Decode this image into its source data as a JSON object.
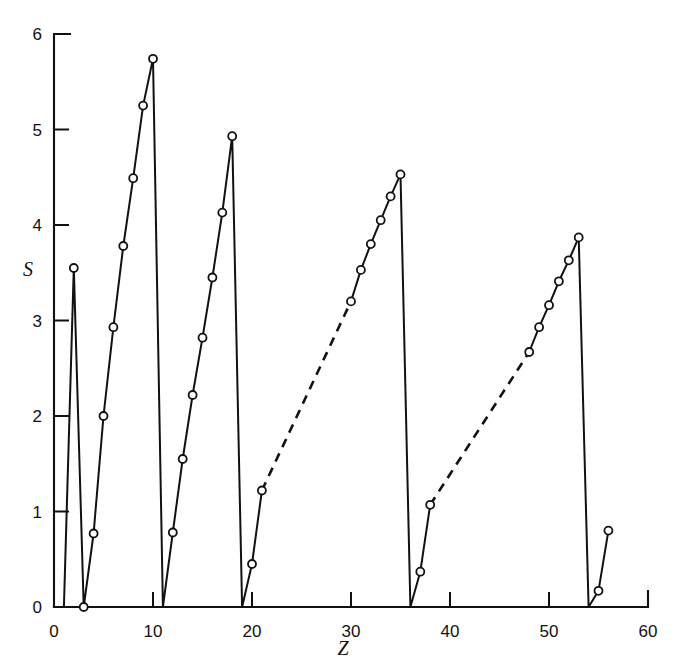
{
  "chart_data": {
    "type": "line",
    "title": "",
    "xlabel": "Z",
    "ylabel": "S",
    "xlim": [
      0,
      60
    ],
    "ylim": [
      0,
      6
    ],
    "grid": false,
    "legend": null,
    "x_ticks": [
      0,
      10,
      20,
      30,
      40,
      50,
      60
    ],
    "x_tick_labels": [
      "0",
      "10",
      "20",
      "30",
      "40",
      "50",
      "60"
    ],
    "x_minor_ticks": [],
    "y_ticks": [
      0,
      1,
      2,
      3,
      4,
      5,
      6
    ],
    "y_tick_labels": [
      "0",
      "1",
      "2",
      "3",
      "4",
      "5",
      "6"
    ],
    "marker": "open-circle",
    "series": [
      {
        "name": "S vs Z",
        "x": [
          1,
          2,
          3,
          4,
          5,
          6,
          7,
          8,
          9,
          10,
          11,
          12,
          13,
          14,
          15,
          16,
          17,
          18,
          19,
          20,
          21,
          30,
          31,
          32,
          33,
          34,
          35,
          36,
          37,
          38,
          48,
          49,
          50,
          51,
          52,
          53,
          54,
          55,
          56
        ],
        "y": [
          0.0,
          3.55,
          0.0,
          0.77,
          2.0,
          2.93,
          3.78,
          4.49,
          5.25,
          5.74,
          0.0,
          0.78,
          1.55,
          2.22,
          2.82,
          3.45,
          4.13,
          4.93,
          0.0,
          0.45,
          1.22,
          3.2,
          3.53,
          3.8,
          4.05,
          4.3,
          4.53,
          0.0,
          0.37,
          1.07,
          2.67,
          2.93,
          3.16,
          3.41,
          3.63,
          3.87,
          0.0,
          0.17,
          0.8
        ],
        "dashed_segments": [
          {
            "from_index": 20,
            "to_index": 21,
            "note": "gap across transition metals Z=21 to Z=30"
          },
          {
            "from_index": 29,
            "to_index": 30,
            "note": "gap across transition metals Z=38 to Z=48"
          }
        ],
        "markers_hidden_at_x": [
          1,
          11,
          19,
          36,
          54
        ]
      }
    ]
  },
  "axes": {
    "y_label": "S",
    "x_label": "Z"
  }
}
